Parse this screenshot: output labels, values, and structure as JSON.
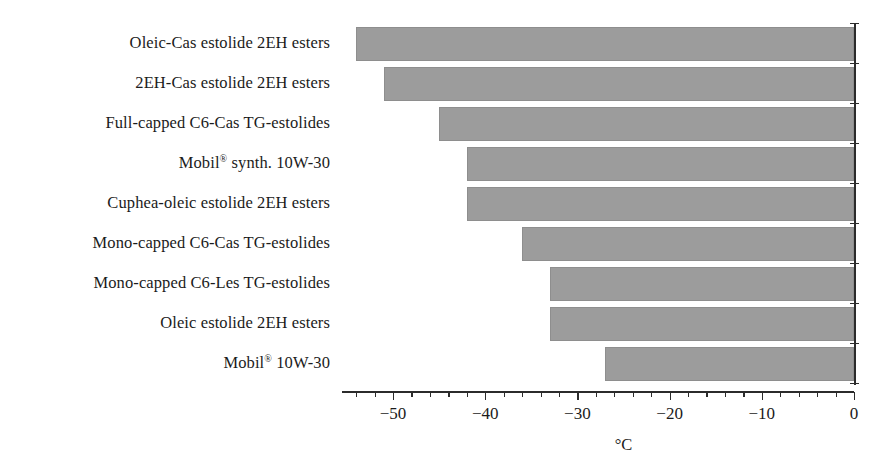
{
  "chart_data": {
    "type": "bar",
    "orientation": "horizontal",
    "title": "",
    "xlabel": "°C",
    "ylabel": "",
    "xlim": [
      -55.5,
      0
    ],
    "xticks": [
      -50,
      -40,
      -30,
      -20,
      -10,
      0
    ],
    "xticklabels": [
      "−50",
      "−40",
      "−30",
      "−20",
      "−10",
      "0"
    ],
    "minor_tick_step": 2,
    "grid": false,
    "legend": null,
    "bar_color": "#9c9c9c",
    "bar_edge_color": "#8e8e8e",
    "axis_color": "#2b2b2b",
    "categories": [
      "Oleic-Cas estolide 2EH esters",
      "2EH-Cas estolide 2EH esters",
      "Full-capped C6-Cas TG-estolides",
      "Mobil® synth. 10W-30",
      "Cuphea-oleic estolide 2EH esters",
      "Mono-capped C6-Cas TG-estolides",
      "Mono-capped C6-Les TG-estolides",
      "Oleic estolide 2EH esters",
      "Mobil® 10W-30"
    ],
    "values": [
      -54,
      -51,
      -45,
      -42,
      -42,
      -36,
      -33,
      -33,
      -27
    ]
  },
  "labels": [
    {
      "pre": "Oleic-Cas estolide 2EH esters",
      "sup": "",
      "post": ""
    },
    {
      "pre": "2EH-Cas estolide 2EH esters",
      "sup": "",
      "post": ""
    },
    {
      "pre": "Full-capped C6-Cas TG-estolides",
      "sup": "",
      "post": ""
    },
    {
      "pre": "Mobil",
      "sup": "®",
      "post": " synth. 10W-30"
    },
    {
      "pre": "Cuphea-oleic estolide 2EH esters",
      "sup": "",
      "post": ""
    },
    {
      "pre": "Mono-capped C6-Cas TG-estolides",
      "sup": "",
      "post": ""
    },
    {
      "pre": "Mono-capped C6-Les TG-estolides",
      "sup": "",
      "post": ""
    },
    {
      "pre": "Oleic estolide 2EH esters",
      "sup": "",
      "post": ""
    },
    {
      "pre": "Mobil",
      "sup": "®",
      "post": " 10W-30"
    }
  ]
}
